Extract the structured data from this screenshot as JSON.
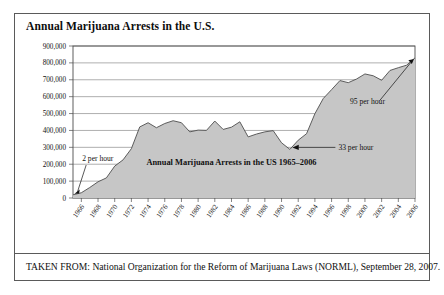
{
  "figure": {
    "title": "Annual Marijuana Arrests in the U.S.",
    "source_note": "TAKEN FROM: National Organization for the Reform of Marijuana Laws (NORML), September 28, 2007.",
    "border_color": "#5a5a5a"
  },
  "chart_data": {
    "type": "area",
    "title": "Annual Marijuana Arrests in the U.S.",
    "inner_caption": "Annual Marijuana Arrests in the US 1965–2006",
    "xlabel": "",
    "ylabel": "",
    "ylim": [
      0,
      900000
    ],
    "xlim": [
      1965,
      2006
    ],
    "grid": true,
    "legend_position": "none",
    "fill_color": "#c6c6c6",
    "line_color": "#4d4d4d",
    "ytick_labels": [
      "0",
      "100,000",
      "200,000",
      "300,000",
      "400,000",
      "500,000",
      "600,000",
      "700,000",
      "800,000",
      "900,000"
    ],
    "ytick_values": [
      0,
      100000,
      200000,
      300000,
      400000,
      500000,
      600000,
      700000,
      800000,
      900000
    ],
    "xtick_labels": [
      "1966",
      "1968",
      "1970",
      "1972",
      "1974",
      "1976",
      "1978",
      "1980",
      "1982",
      "1984",
      "1986",
      "1988",
      "1990",
      "1992",
      "1994",
      "1996",
      "1998",
      "2000",
      "2002",
      "2004",
      "2006"
    ],
    "xtick_values": [
      1966,
      1968,
      1970,
      1972,
      1974,
      1976,
      1978,
      1980,
      1982,
      1984,
      1986,
      1988,
      1990,
      1992,
      1994,
      1996,
      1998,
      2000,
      2002,
      2004,
      2006
    ],
    "x": [
      1965,
      1966,
      1967,
      1968,
      1969,
      1970,
      1971,
      1972,
      1973,
      1974,
      1975,
      1976,
      1977,
      1978,
      1979,
      1980,
      1981,
      1982,
      1983,
      1984,
      1985,
      1986,
      1987,
      1988,
      1989,
      1990,
      1991,
      1992,
      1993,
      1994,
      1995,
      1996,
      1997,
      1998,
      1999,
      2000,
      2001,
      2002,
      2003,
      2004,
      2005,
      2006
    ],
    "values": [
      18800,
      31100,
      61800,
      95900,
      118900,
      188900,
      225800,
      292200,
      420700,
      445600,
      416100,
      441100,
      457600,
      445800,
      391600,
      401900,
      400300,
      455600,
      406000,
      419400,
      451100,
      361800,
      378700,
      391600,
      398900,
      326900,
      287900,
      342300,
      380700,
      499100,
      588900,
      641600,
      695200,
      682900,
      704800,
      734500,
      723600,
      697100,
      755200,
      771600,
      786500,
      829600
    ]
  },
  "annotations": [
    {
      "id": "annot-2-per-hour",
      "label": "2 per hour",
      "target_year": 1965,
      "target_value": 18800
    },
    {
      "id": "annot-33-per-hour",
      "label": "33 per hour",
      "target_year": 1991,
      "target_value": 287900
    },
    {
      "id": "annot-95-per-hour",
      "label": "95 per hour",
      "target_year": 2006,
      "target_value": 829600
    }
  ]
}
